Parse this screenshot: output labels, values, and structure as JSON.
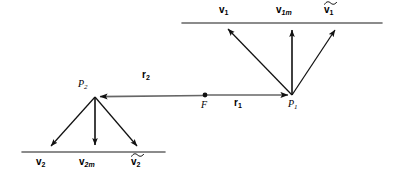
{
  "figure": {
    "stroke_color": "#555555",
    "arrow_color": "#111111",
    "text_color": "#000000",
    "background": "#ffffff",
    "width": 400,
    "height": 178
  },
  "points": {
    "p1": {
      "label": "P",
      "sub": "1",
      "x": 292,
      "y": 95
    },
    "p2": {
      "label": "P",
      "sub": "2",
      "x": 95,
      "y": 97
    },
    "focus": {
      "label": "F",
      "x": 205,
      "y": 95
    }
  },
  "radius_vectors": [
    {
      "name": "r1",
      "label": "r",
      "sub": "1",
      "from_x": 205,
      "from_y": 95,
      "to_x": 292,
      "to_y": 95,
      "label_x": 238,
      "label_y": 99
    },
    {
      "name": "r2",
      "label": "r",
      "sub": "2",
      "from_x": 205,
      "from_y": 95,
      "to_x": 95,
      "to_y": 97,
      "label_x": 146,
      "label_y": 74
    }
  ],
  "top_line": {
    "x1": 182,
    "y1": 23,
    "x2": 382,
    "y2": 23
  },
  "bottom_line": {
    "x1": 22,
    "y1": 152,
    "x2": 165,
    "y2": 152
  },
  "top_vectors": [
    {
      "name": "v1",
      "label": "v",
      "sub": "1",
      "tilde": false,
      "from_x": 292,
      "from_y": 95,
      "to_x": 225,
      "to_y": 26,
      "label_x": 219,
      "label_y": 5
    },
    {
      "name": "v1m",
      "label": "v",
      "sub": "1m",
      "tilde": false,
      "from_x": 292,
      "from_y": 95,
      "to_x": 292,
      "to_y": 26,
      "label_x": 278,
      "label_y": 5
    },
    {
      "name": "v1tilde",
      "label": "v",
      "sub": "1",
      "tilde": true,
      "from_x": 292,
      "from_y": 95,
      "to_x": 338,
      "to_y": 26,
      "label_x": 325,
      "label_y": 5
    }
  ],
  "bottom_vectors": [
    {
      "name": "v2",
      "label": "v",
      "sub": "2",
      "tilde": false,
      "from_x": 95,
      "from_y": 97,
      "to_x": 48,
      "to_y": 149,
      "label_x": 37,
      "label_y": 157
    },
    {
      "name": "v2m",
      "label": "v",
      "sub": "2m",
      "tilde": false,
      "from_x": 95,
      "from_y": 97,
      "to_x": 95,
      "to_y": 149,
      "label_x": 81,
      "label_y": 157
    },
    {
      "name": "v2tilde",
      "label": "v",
      "sub": "2",
      "tilde": true,
      "from_x": 95,
      "from_y": 97,
      "to_x": 140,
      "to_y": 149,
      "label_x": 133,
      "label_y": 157
    }
  ]
}
